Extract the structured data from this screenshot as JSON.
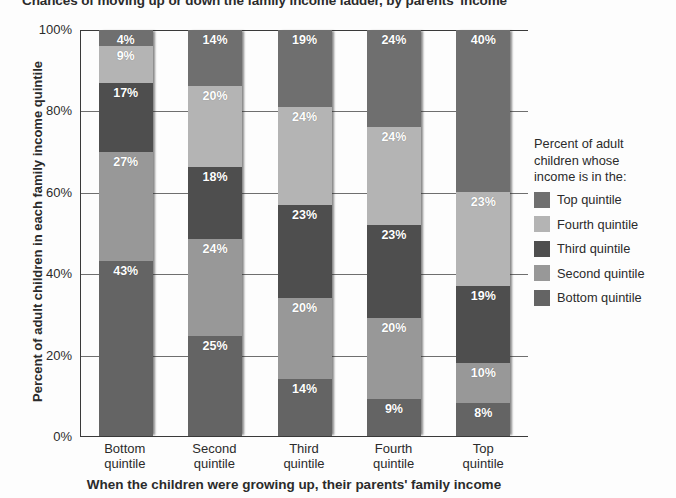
{
  "title": "Chances of moving up or down the family income ladder, by parents' income",
  "axes": {
    "y_title": "Percent of adult children in each family income quintile",
    "x_title": "When the children were growing up, their parents' family income",
    "y_ticks": [
      "100%",
      "80%",
      "60%",
      "40%",
      "20%",
      "0%"
    ]
  },
  "legend": {
    "title_line1": "Percent of adult",
    "title_line2": "children whose",
    "title_line3": "income is in the:",
    "items": [
      {
        "label": "Top quintile",
        "color": "#6f6f6f"
      },
      {
        "label": "Fourth quintile",
        "color": "#b4b4b4"
      },
      {
        "label": "Third quintile",
        "color": "#4e4e4e"
      },
      {
        "label": "Second quintile",
        "color": "#989898"
      },
      {
        "label": "Bottom quintile",
        "color": "#646464"
      }
    ]
  },
  "categories": [
    {
      "line1": "Bottom",
      "line2": "quintile"
    },
    {
      "line1": "Second",
      "line2": "quintile"
    },
    {
      "line1": "Third",
      "line2": "quintile"
    },
    {
      "line1": "Fourth",
      "line2": "quintile"
    },
    {
      "line1": "Top",
      "line2": "quintile"
    }
  ],
  "bars": [
    {
      "segments": [
        {
          "label": "4%",
          "value": 4
        },
        {
          "label": "9%",
          "value": 9
        },
        {
          "label": "17%",
          "value": 17
        },
        {
          "label": "27%",
          "value": 27
        },
        {
          "label": "43%",
          "value": 43
        }
      ]
    },
    {
      "segments": [
        {
          "label": "14%",
          "value": 14
        },
        {
          "label": "20%",
          "value": 20
        },
        {
          "label": "18%",
          "value": 18
        },
        {
          "label": "24%",
          "value": 24
        },
        {
          "label": "25%",
          "value": 25
        }
      ]
    },
    {
      "segments": [
        {
          "label": "19%",
          "value": 19
        },
        {
          "label": "24%",
          "value": 24
        },
        {
          "label": "23%",
          "value": 23
        },
        {
          "label": "20%",
          "value": 20
        },
        {
          "label": "14%",
          "value": 14
        }
      ]
    },
    {
      "segments": [
        {
          "label": "24%",
          "value": 24
        },
        {
          "label": "24%",
          "value": 24
        },
        {
          "label": "23%",
          "value": 23
        },
        {
          "label": "20%",
          "value": 20
        },
        {
          "label": "9%",
          "value": 9
        }
      ]
    },
    {
      "segments": [
        {
          "label": "40%",
          "value": 40
        },
        {
          "label": "23%",
          "value": 23
        },
        {
          "label": "19%",
          "value": 19
        },
        {
          "label": "10%",
          "value": 10
        },
        {
          "label": "8%",
          "value": 8
        }
      ]
    }
  ],
  "chart_data": {
    "type": "bar",
    "subtype": "stacked-100-percent",
    "title": "Chances of moving up or down the family income ladder, by parents' income",
    "xlabel": "When the children were growing up, their parents' family income",
    "ylabel": "Percent of adult children in each family income quintile",
    "categories": [
      "Bottom quintile",
      "Second quintile",
      "Third quintile",
      "Fourth quintile",
      "Top quintile"
    ],
    "series": [
      {
        "name": "Top quintile",
        "color": "#6f6f6f",
        "values": [
          4,
          14,
          19,
          24,
          40
        ]
      },
      {
        "name": "Fourth quintile",
        "color": "#b4b4b4",
        "values": [
          9,
          20,
          24,
          24,
          23
        ]
      },
      {
        "name": "Third quintile",
        "color": "#4e4e4e",
        "values": [
          17,
          18,
          23,
          23,
          19
        ]
      },
      {
        "name": "Second quintile",
        "color": "#989898",
        "values": [
          27,
          24,
          20,
          20,
          10
        ]
      },
      {
        "name": "Bottom quintile",
        "color": "#646464",
        "values": [
          43,
          25,
          14,
          9,
          8
        ]
      }
    ],
    "stack_order_top_to_bottom": [
      "Top quintile",
      "Fourth quintile",
      "Third quintile",
      "Second quintile",
      "Bottom quintile"
    ],
    "ylim": [
      0,
      100
    ],
    "yticks": [
      0,
      20,
      40,
      60,
      80,
      100
    ],
    "ytick_labels": [
      "0%",
      "20%",
      "40%",
      "60%",
      "80%",
      "100%"
    ],
    "grid": "horizontal",
    "legend_position": "right",
    "legend_title": "Percent of adult children whose income is in the:"
  }
}
